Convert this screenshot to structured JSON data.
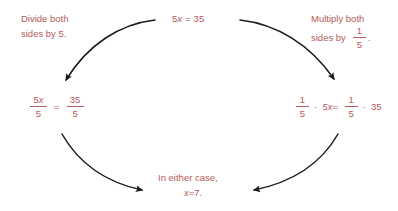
{
  "diagram": {
    "text_color": "#b5595a",
    "arrow_color": "#1a1a1a",
    "background": "#ffffff"
  },
  "top_equation": {
    "coefficient": "5",
    "variable": "x",
    "equals": "=",
    "result": "35",
    "full": "5x = 35"
  },
  "left_branch": {
    "label_line1": "Divide both",
    "label_line2": "sides by 5.",
    "equation": {
      "left_numerator_coeff": "5",
      "left_numerator_var": "x",
      "left_denominator": "5",
      "equals": "=",
      "right_numerator": "35",
      "right_denominator": "5",
      "full": "5x/5 = 35/5"
    }
  },
  "right_branch": {
    "label_line1": "Multiply both",
    "label_line2": "sides by",
    "label_fraction_numerator": "1",
    "label_fraction_denominator": "5",
    "label_period": ".",
    "equation": {
      "left_frac_numerator": "1",
      "left_frac_denominator": "5",
      "dot1": "·",
      "left_term": "5x=",
      "right_frac_numerator": "1",
      "right_frac_denominator": "5",
      "dot2": "·",
      "right_term": "35",
      "full": "1/5 · 5x = 1/5 · 35"
    }
  },
  "conclusion": {
    "line1": "In either case,",
    "line2": "x = 7.",
    "variable": "x",
    "equals": "=",
    "value": "7."
  },
  "arrows": [
    {
      "name": "arrow-top-left",
      "from": "top-equation",
      "to": "left-equation",
      "direction": "down-left"
    },
    {
      "name": "arrow-top-right",
      "from": "top-equation",
      "to": "right-equation",
      "direction": "down-right"
    },
    {
      "name": "arrow-bottom-left",
      "from": "left-equation",
      "to": "conclusion",
      "direction": "down-right"
    },
    {
      "name": "arrow-bottom-right",
      "from": "right-equation",
      "to": "conclusion",
      "direction": "down-left"
    }
  ]
}
